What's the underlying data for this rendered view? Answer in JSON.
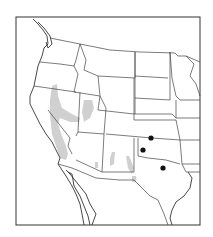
{
  "map": {
    "region": "Western and Central United States with northern Mexico",
    "frame": {
      "x": 16,
      "y": 17,
      "width": 184,
      "height": 208
    },
    "colors": {
      "range_fill": "#c8c8c8",
      "locality_dot": "#111111",
      "outline": "#333333",
      "background": "#ffffff"
    },
    "range_areas": [
      {
        "name": "range-nevada-california",
        "description": "Gray shaded range along eastern California / western Nevada"
      },
      {
        "name": "range-utah",
        "description": "Gray shaded range in western Utah"
      },
      {
        "name": "range-arizona",
        "description": "Small gray patch in southern Arizona"
      },
      {
        "name": "range-new-mexico",
        "description": "Gray patches in New Mexico"
      }
    ],
    "localities": [
      {
        "name": "locality-oklahoma-panhandle",
        "x": 151,
        "y": 138
      },
      {
        "name": "locality-texas-panhandle",
        "x": 143,
        "y": 150
      },
      {
        "name": "locality-north-texas",
        "x": 163,
        "y": 168
      }
    ]
  }
}
